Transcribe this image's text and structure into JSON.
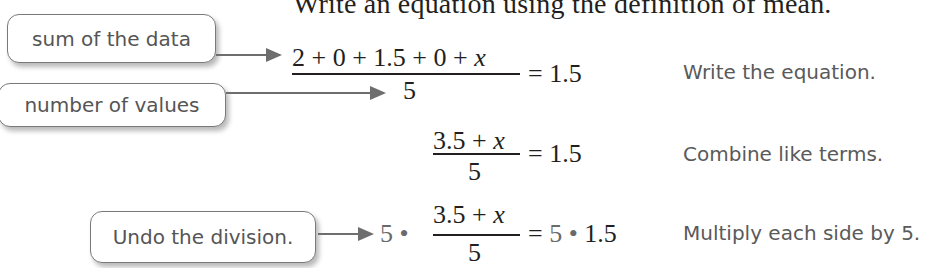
{
  "heading": "Write an equation using the definition of mean.",
  "callouts": {
    "sum": "sum of the data",
    "count": "number of values",
    "undo": "Undo the division."
  },
  "steps": [
    {
      "numerator_prefix": "2 + 0 + 1.5 + 0 + ",
      "variable": "x",
      "denominator": "5",
      "rhs": "= 1.5",
      "note": "Write the equation."
    },
    {
      "numerator_prefix": "3.5 + ",
      "variable": "x",
      "denominator": "5",
      "rhs": "= 1.5",
      "note": "Combine like terms."
    },
    {
      "lhs_multiplier": "5 •",
      "numerator_prefix": "3.5 + ",
      "variable": "x",
      "denominator": "5",
      "rhs_equals": "=",
      "rhs_multiplier": "5 •",
      "rhs_value": "1.5",
      "note": "Multiply each side by 5."
    }
  ],
  "colors": {
    "text": "#231f20",
    "annotation_gray": "#6a6a6a",
    "callout_border": "#7a7a7a"
  }
}
